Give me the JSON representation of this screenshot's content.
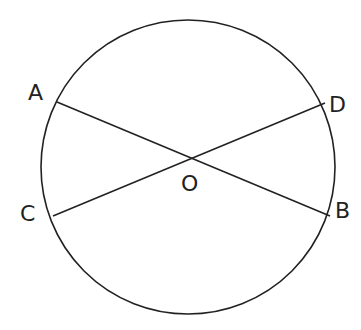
{
  "diagram": {
    "stroke_color": "#222222",
    "background": "#ffffff",
    "circle": {
      "cx": 188,
      "cy": 167,
      "r": 147
    },
    "chords": [
      {
        "name": "AB",
        "from": "A",
        "to": "B",
        "x1": 57,
        "y1": 102,
        "x2": 330,
        "y2": 216
      },
      {
        "name": "CD",
        "from": "C",
        "to": "D",
        "x1": 53,
        "y1": 216,
        "x2": 325,
        "y2": 103
      }
    ],
    "labels": {
      "A": "A",
      "B": "B",
      "C": "C",
      "D": "D",
      "O": "O"
    }
  }
}
